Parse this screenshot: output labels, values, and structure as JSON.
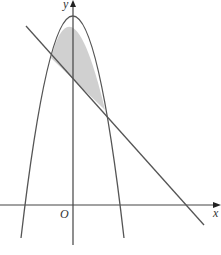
{
  "diagram": {
    "labels": {
      "y_axis": "y",
      "x_axis": "x",
      "origin": "O"
    },
    "curves": [
      "parabola (downward, vertex on y-axis)",
      "straight line with negative gradient"
    ],
    "shaded_region": "region between parabola and line, above line",
    "colors": {
      "stroke": "#555555",
      "shade": "#d0d0d0"
    }
  }
}
